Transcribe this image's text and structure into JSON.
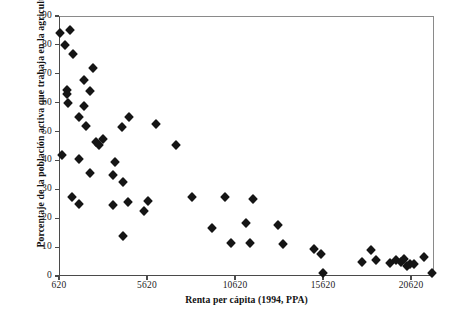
{
  "chart_data": {
    "type": "scatter",
    "title": "",
    "xlabel": "Renta per cápita (1994, PPA)",
    "ylabel": "Porcentaje de la población activa que trabaja en la agricultura, 1994",
    "xlim": [
      620,
      21925
    ],
    "ylim": [
      0,
      90
    ],
    "xticks": [
      620,
      5620,
      10620,
      15620,
      20620
    ],
    "xtick_labels": [
      "620",
      "5620",
      "10620",
      "15620",
      "20620"
    ],
    "yticks": [
      0,
      10,
      20,
      30,
      40,
      50,
      60,
      70,
      80,
      90
    ],
    "ytick_labels": [
      "0",
      "10",
      "20",
      "30",
      "40",
      "50",
      "60",
      "70",
      "80",
      "90"
    ],
    "grid": false,
    "legend": null,
    "marker": "filled-diamond",
    "marker_color": "#151515",
    "series": [
      {
        "name": "Países",
        "points": [
          [
            680,
            84
          ],
          [
            1250,
            85
          ],
          [
            960,
            80
          ],
          [
            1420,
            77
          ],
          [
            2560,
            72
          ],
          [
            2050,
            68
          ],
          [
            1080,
            64.5
          ],
          [
            1080,
            63
          ],
          [
            2390,
            64
          ],
          [
            1140,
            60
          ],
          [
            2050,
            59
          ],
          [
            1760,
            55
          ],
          [
            4600,
            55
          ],
          [
            2160,
            52
          ],
          [
            6130,
            52.5
          ],
          [
            4200,
            51.5
          ],
          [
            2730,
            46.5
          ],
          [
            3130,
            47.5
          ],
          [
            2900,
            45.5
          ],
          [
            7270,
            45.5
          ],
          [
            790,
            42
          ],
          [
            1760,
            40.5
          ],
          [
            3810,
            39.5
          ],
          [
            2390,
            35.5
          ],
          [
            3700,
            35
          ],
          [
            4260,
            32.5
          ],
          [
            1370,
            27.5
          ],
          [
            3700,
            24.5
          ],
          [
            1760,
            25
          ],
          [
            4540,
            25.5
          ],
          [
            5680,
            26
          ],
          [
            5450,
            22.5
          ],
          [
            8180,
            27.5
          ],
          [
            10050,
            27.5
          ],
          [
            11640,
            26.5
          ],
          [
            4260,
            14
          ],
          [
            9310,
            16.5
          ],
          [
            11250,
            18.5
          ],
          [
            13070,
            17.5
          ],
          [
            10390,
            11.5
          ],
          [
            11470,
            11.5
          ],
          [
            13350,
            11
          ],
          [
            15110,
            9.5
          ],
          [
            15510,
            7.5
          ],
          [
            15620,
            1
          ],
          [
            17840,
            5
          ],
          [
            18350,
            9
          ],
          [
            18630,
            5.5
          ],
          [
            19430,
            4.5
          ],
          [
            19770,
            5.5
          ],
          [
            20050,
            5
          ],
          [
            20220,
            6
          ],
          [
            20390,
            3.5
          ],
          [
            20560,
            4
          ],
          [
            20790,
            4
          ],
          [
            21360,
            6.5
          ],
          [
            21810,
            1
          ]
        ]
      }
    ]
  },
  "axis": {
    "y_title": "Porcentaje de la población activa que trabaja en la agricultura, 1994",
    "x_title": "Renta per cápita (1994, PPA)"
  }
}
